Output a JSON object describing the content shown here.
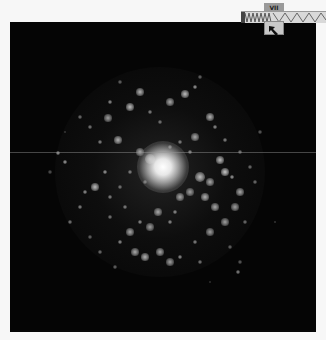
{
  "viewer": {
    "background": "#050505",
    "streak_y": 130,
    "core": {
      "x": 153,
      "y": 145,
      "r": 13
    },
    "halo": {
      "x": 150,
      "y": 150,
      "r": 105
    },
    "knots": [
      [
        150,
        143,
        5,
        230
      ],
      [
        140,
        137,
        4,
        200
      ],
      [
        130,
        130,
        3,
        170
      ],
      [
        108,
        118,
        3,
        180
      ],
      [
        98,
        96,
        3,
        160
      ],
      [
        120,
        85,
        3,
        190
      ],
      [
        130,
        70,
        3,
        180
      ],
      [
        160,
        80,
        3,
        170
      ],
      [
        175,
        72,
        3,
        190
      ],
      [
        185,
        65,
        2,
        160
      ],
      [
        200,
        95,
        3,
        180
      ],
      [
        205,
        105,
        2,
        150
      ],
      [
        185,
        115,
        3,
        170
      ],
      [
        215,
        118,
        2,
        140
      ],
      [
        100,
        80,
        2,
        150
      ],
      [
        140,
        90,
        2,
        140
      ],
      [
        150,
        100,
        2,
        130
      ],
      [
        90,
        120,
        2,
        140
      ],
      [
        80,
        105,
        2,
        130
      ],
      [
        70,
        95,
        2,
        120
      ],
      [
        210,
        138,
        3,
        190
      ],
      [
        215,
        150,
        3,
        200
      ],
      [
        200,
        160,
        3,
        170
      ],
      [
        190,
        155,
        4,
        190
      ],
      [
        222,
        155,
        2,
        160
      ],
      [
        230,
        170,
        3,
        170
      ],
      [
        225,
        185,
        3,
        160
      ],
      [
        205,
        185,
        3,
        170
      ],
      [
        215,
        200,
        3,
        160
      ],
      [
        200,
        210,
        3,
        160
      ],
      [
        195,
        175,
        3,
        180
      ],
      [
        180,
        170,
        3,
        160
      ],
      [
        170,
        175,
        3,
        170
      ],
      [
        165,
        190,
        2,
        150
      ],
      [
        148,
        190,
        3,
        170
      ],
      [
        160,
        200,
        2,
        150
      ],
      [
        140,
        205,
        3,
        160
      ],
      [
        130,
        200,
        2,
        150
      ],
      [
        120,
        210,
        3,
        170
      ],
      [
        110,
        220,
        2,
        150
      ],
      [
        125,
        230,
        3,
        170
      ],
      [
        135,
        235,
        3,
        180
      ],
      [
        150,
        230,
        3,
        170
      ],
      [
        160,
        240,
        3,
        160
      ],
      [
        170,
        235,
        2,
        150
      ],
      [
        185,
        220,
        2,
        140
      ],
      [
        190,
        240,
        2,
        130
      ],
      [
        95,
        150,
        2,
        160
      ],
      [
        85,
        165,
        3,
        190
      ],
      [
        75,
        170,
        2,
        150
      ],
      [
        70,
        185,
        2,
        140
      ],
      [
        60,
        200,
        2,
        130
      ],
      [
        55,
        140,
        2,
        160
      ],
      [
        48,
        131,
        2,
        160
      ],
      [
        100,
        175,
        2,
        140
      ],
      [
        110,
        165,
        2,
        130
      ],
      [
        115,
        185,
        2,
        140
      ],
      [
        120,
        150,
        2,
        140
      ],
      [
        135,
        160,
        2,
        150
      ],
      [
        100,
        195,
        2,
        130
      ],
      [
        180,
        130,
        2,
        150
      ],
      [
        170,
        120,
        2,
        140
      ],
      [
        160,
        125,
        2,
        150
      ],
      [
        230,
        130,
        2,
        130
      ],
      [
        240,
        145,
        2,
        120
      ],
      [
        245,
        160,
        2,
        120
      ],
      [
        235,
        200,
        2,
        120
      ],
      [
        220,
        225,
        2,
        110
      ],
      [
        230,
        240,
        2,
        100
      ],
      [
        228,
        250,
        2,
        140
      ],
      [
        90,
        230,
        2,
        120
      ],
      [
        80,
        215,
        2,
        110
      ],
      [
        105,
        245,
        2,
        110
      ],
      [
        110,
        60,
        2,
        110
      ],
      [
        190,
        55,
        2,
        110
      ],
      [
        250,
        110,
        2,
        100
      ],
      [
        40,
        150,
        2,
        90
      ],
      [
        55,
        110,
        1,
        90
      ],
      [
        265,
        200,
        1,
        90
      ],
      [
        200,
        260,
        1,
        80
      ]
    ]
  },
  "toolbar": {
    "tab_label": "VII",
    "tool_button": "arrow-pointer-icon"
  }
}
